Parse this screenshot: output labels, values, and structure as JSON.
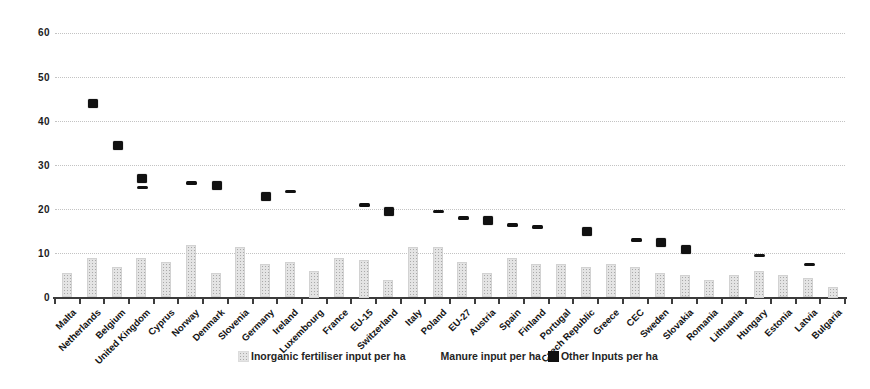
{
  "title": "",
  "y_axis": {
    "tick_labels": [
      "0",
      "10",
      "20",
      "30",
      "40",
      "50",
      "60"
    ]
  },
  "legend": {
    "items": [
      {
        "label": "Inorganic fertiliser input per ha",
        "swatch": "textured-gray-square",
        "color": "#e4e4e4"
      },
      {
        "label": "Manure input per ha",
        "swatch": "invisible-white-square",
        "color": "#ffffff"
      },
      {
        "label": "Other Inputs per ha",
        "swatch": "filled-black-square",
        "color": "#111111"
      }
    ]
  },
  "colors": {
    "background": "#ffffff",
    "bar_fill": "#e4e4e4",
    "bar_speckle": "#a9a9a9",
    "marker": "#111111",
    "gridline": "#b9b9b9",
    "axis": "#3c3c3c",
    "text": "#1c1c1c"
  },
  "chart_data": {
    "type": "bar",
    "subtype": "bar-with-scatter-markers",
    "title": "",
    "xlabel": "",
    "ylabel": "",
    "ylim": [
      0,
      60
    ],
    "y_ticks": [
      0,
      10,
      20,
      30,
      40,
      50,
      60
    ],
    "grid": "horizontal-dotted",
    "legend_position": "bottom-center",
    "categories": [
      "Malta",
      "Netherlands",
      "Belgium",
      "United Kingdom",
      "Cyprus",
      "Norway",
      "Denmark",
      "Slovenia",
      "Germany",
      "Ireland",
      "Luxembourg",
      "France",
      "EU-15",
      "Switzerland",
      "Italy",
      "Poland",
      "EU-27",
      "Austria",
      "Spain",
      "Finland",
      "Portugal",
      "Czech Republic",
      "Greece",
      "CEC",
      "Sweden",
      "Slovakia",
      "Romania",
      "Lithuania",
      "Hungary",
      "Estonia",
      "Latvia",
      "Bulgaria"
    ],
    "series": [
      {
        "name": "Inorganic fertiliser input per ha",
        "type": "bar",
        "values": [
          5.5,
          9,
          7,
          9,
          8,
          12,
          5.5,
          11.5,
          7.5,
          8,
          6,
          9,
          8.5,
          4,
          11.5,
          11.5,
          8,
          5.5,
          9,
          7.5,
          7.5,
          7,
          7.5,
          7,
          5.5,
          5,
          4,
          5,
          6,
          5,
          4.5,
          2.5
        ]
      },
      {
        "name": "Manure input per ha",
        "type": "scatter",
        "marker": "square",
        "values": [
          null,
          44,
          34.5,
          27,
          null,
          null,
          25.5,
          null,
          23,
          null,
          null,
          null,
          null,
          19.5,
          null,
          null,
          null,
          17.5,
          null,
          null,
          null,
          15,
          null,
          null,
          12.5,
          11,
          null,
          null,
          null,
          null,
          null,
          null
        ]
      },
      {
        "name": "Other Inputs per ha",
        "type": "scatter",
        "marker": "dash",
        "values": [
          null,
          null,
          null,
          25,
          null,
          26,
          null,
          null,
          null,
          24,
          null,
          null,
          21,
          null,
          null,
          19.5,
          18,
          null,
          16.5,
          16,
          null,
          null,
          null,
          13,
          null,
          null,
          null,
          null,
          9.5,
          null,
          7.5,
          null
        ]
      }
    ]
  }
}
